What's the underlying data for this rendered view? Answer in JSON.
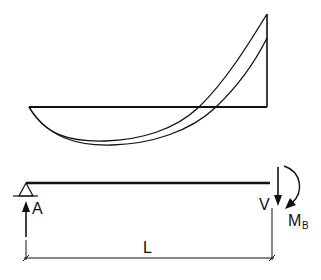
{
  "diagram": {
    "moment_diagram": {
      "description": "Bending moment diagrams (two curves) for a simply supported beam with end moment",
      "baseline": {
        "x1": 29,
        "x2": 267,
        "y": 107
      },
      "curves": [
        {
          "name": "curve-outer",
          "start": [
            29,
            107
          ],
          "min": [
            105,
            141
          ],
          "cross": [
            199,
            107
          ],
          "end": [
            267,
            14
          ]
        },
        {
          "name": "curve-inner",
          "start": [
            29,
            107
          ],
          "min": [
            112,
            145
          ],
          "cross": [
            216,
            107
          ],
          "end": [
            267,
            38
          ]
        }
      ]
    },
    "beam": {
      "labels": {
        "support_a": "A",
        "shear": "V",
        "moment": "M",
        "moment_sub": "B",
        "length": "L"
      }
    }
  }
}
